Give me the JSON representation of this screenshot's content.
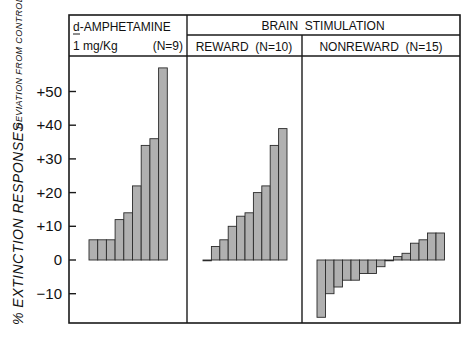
{
  "chart_data": {
    "type": "bar",
    "title": "",
    "ylabel": "% EXTINCTION RESPONSES",
    "ylabel_sub": "DEVIATION FROM CONTROL",
    "xlabel": "",
    "ylim": [
      -18,
      60
    ],
    "yticks": [
      {
        "value": 50,
        "label": "+50"
      },
      {
        "value": 40,
        "label": "+40"
      },
      {
        "value": 30,
        "label": "+30"
      },
      {
        "value": 20,
        "label": "+20"
      },
      {
        "value": 10,
        "label": "+10"
      },
      {
        "value": 0,
        "label": "0"
      },
      {
        "value": -10,
        "label": "−10"
      }
    ],
    "grid": false,
    "legend": null,
    "group_header": "BRAIN  STIMULATION",
    "panels": [
      {
        "name": "d-AMPHETAMINE 1 mg/Kg",
        "header_line1": "d-AMPHETAMINE",
        "header_line2_left": "1 mg/Kg",
        "header_line2_right": "(N=9)",
        "n": 9,
        "values": [
          6,
          6,
          6,
          12,
          14,
          22,
          34,
          36,
          57
        ]
      },
      {
        "name": "Brain Stimulation: REWARD",
        "header": "REWARD  (N=10)",
        "n": 10,
        "values": [
          0,
          4,
          6,
          10,
          13,
          14,
          20,
          22,
          34,
          39
        ]
      },
      {
        "name": "Brain Stimulation: NONREWARD",
        "header": "NONREWARD  (N=15)",
        "n": 15,
        "values": [
          -17,
          -10,
          -8,
          -6,
          -6,
          -4,
          -4,
          -2,
          0,
          1,
          2,
          5,
          6,
          8,
          8
        ]
      }
    ]
  }
}
